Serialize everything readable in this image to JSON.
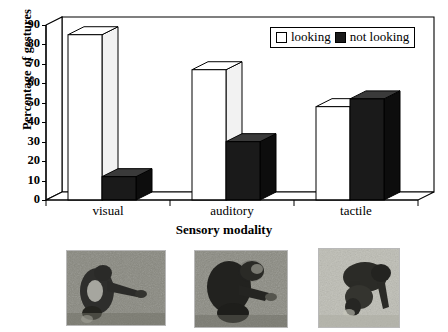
{
  "chart_data": {
    "type": "bar",
    "title": "",
    "subtitle": "",
    "xlabel": "Sensory modality",
    "ylabel": "Percentage of gestures",
    "categories": [
      "visual",
      "auditory",
      "tactile"
    ],
    "series": [
      {
        "name": "looking",
        "values": [
          85,
          67,
          48
        ],
        "color": "#ffffff"
      },
      {
        "name": "not looking",
        "values": [
          12,
          30,
          52
        ],
        "color": "#1a1a1a"
      }
    ],
    "ylim": [
      0,
      90
    ],
    "yticks": [
      0,
      10,
      20,
      30,
      40,
      50,
      60,
      70,
      80,
      90
    ],
    "ytick_labels": [
      "0",
      "10",
      "20",
      "30",
      "40",
      "50",
      "60",
      "70",
      "80",
      "90"
    ],
    "grid": false,
    "legend_position": "top-right",
    "style": "3d-column"
  },
  "legend": {
    "entries": [
      {
        "label": "looking",
        "swatch": "white-square"
      },
      {
        "label": "not looking",
        "swatch": "black-square"
      }
    ]
  },
  "photos": {
    "caption": "",
    "items": [
      {
        "alt": "chimpanzee gesturing while partner looks"
      },
      {
        "alt": "chimpanzee reaching toward partner"
      },
      {
        "alt": "chimpanzee touching partner"
      }
    ]
  }
}
